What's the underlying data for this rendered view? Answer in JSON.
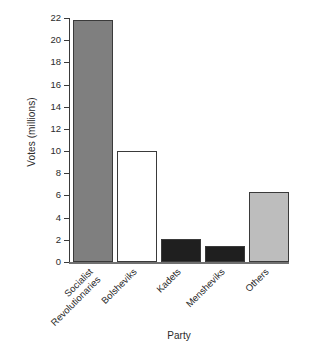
{
  "chart_data": {
    "type": "bar",
    "title": "",
    "xlabel": "Party",
    "ylabel": "Votes (millions)",
    "categories": [
      "Socialist\nRevolutionaries",
      "Bolsheviks",
      "Kadets",
      "Mensheviks",
      "Others"
    ],
    "values": [
      21.8,
      10.0,
      2.1,
      1.4,
      6.3
    ],
    "ylim": [
      0,
      22
    ],
    "yticks": [
      0,
      2,
      4,
      6,
      8,
      10,
      12,
      14,
      16,
      18,
      20,
      22
    ],
    "ytick_labels": [
      "0",
      "2",
      "4",
      "6",
      "8",
      "10",
      "12",
      "14",
      "16",
      "18",
      "20",
      "22"
    ],
    "grid": false,
    "legend": "none",
    "bar_colors": [
      "#7f7f7f",
      "#ffffff",
      "#1f1f1f",
      "#1f1f1f",
      "#bdbdbd"
    ],
    "bar_edge_color": "#3a3a3a",
    "series": [
      {
        "name": "Votes (millions)",
        "values": [
          21.8,
          10.0,
          2.1,
          1.4,
          6.3
        ]
      }
    ]
  }
}
